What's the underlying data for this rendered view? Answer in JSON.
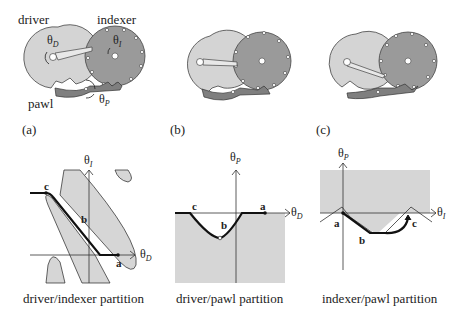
{
  "figure": {
    "top_row": {
      "mechanism_a": {
        "driver_label": "driver",
        "indexer_label": "indexer",
        "pawl_label": "pawl",
        "theta_driver": "θ",
        "theta_driver_sub": "D",
        "theta_indexer": "θ",
        "theta_indexer_sub": "I",
        "theta_pawl": "θ",
        "theta_pawl_sub": "P"
      },
      "panel_labels": [
        "(a)",
        "(b)",
        "(c)"
      ]
    },
    "bottom_row": [
      {
        "title": "driver/indexer partition",
        "x_axis": "θ",
        "x_sub": "D",
        "y_axis": "θ",
        "y_sub": "I",
        "points": [
          "a",
          "b",
          "c"
        ]
      },
      {
        "title": "driver/pawl partition",
        "x_axis": "θ",
        "x_sub": "D",
        "y_axis": "θ",
        "y_sub": "P",
        "points": [
          "a",
          "b",
          "c"
        ]
      },
      {
        "title": "indexer/pawl partition",
        "x_axis": "θ",
        "x_sub": "I",
        "y_axis": "θ",
        "y_sub": "P",
        "points": [
          "a",
          "b",
          "c"
        ]
      }
    ],
    "colors": {
      "driver_fill": "#d4d4d4",
      "indexer_fill": "#9a9a9a",
      "pawl_fill": "#7f7f7f",
      "region_fill": "#d6d6d6",
      "outline": "#333333",
      "path": "#111111"
    }
  }
}
